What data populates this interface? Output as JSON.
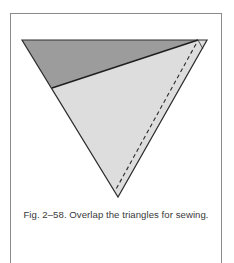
{
  "figure": {
    "caption": "Fig. 2–58. Overlap the triangles for sewing.",
    "colors": {
      "dark_fabric": "#9c9c9c",
      "light_fabric": "#dddddd",
      "outline": "#2e2e2e",
      "frame": "#8a8a8a",
      "background": "#ffffff"
    },
    "shapes": {
      "outer_triangle": {
        "points": "22,40 207,40 118,197",
        "label": "dark triangle (underneath)"
      },
      "overlap_triangle": {
        "points": "52,88 198,40 207,40 118,197",
        "label": "light triangle (on top)"
      },
      "overlap_edge": {
        "x1": 52,
        "y1": 88,
        "x2": 198,
        "y2": 40
      },
      "stitch_line": {
        "x1": 196,
        "y1": 44,
        "x2": 115,
        "y2": 191,
        "label": "seam line (dashed)"
      }
    }
  }
}
